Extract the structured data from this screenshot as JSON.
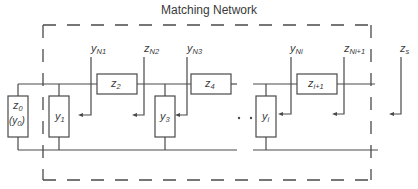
{
  "title": "Matching Network",
  "components": {
    "z0": {
      "main": "z",
      "sub": "0",
      "alt_main": "(y",
      "alt_sub": "0",
      "alt_close": ")"
    },
    "y1": {
      "main": "y",
      "sub": "1"
    },
    "z2": {
      "main": "z",
      "sub": "2"
    },
    "y3": {
      "main": "y",
      "sub": "3"
    },
    "z4": {
      "main": "z",
      "sub": "4"
    },
    "yi": {
      "main": "y",
      "sub": "i"
    },
    "zi1": {
      "main": "z",
      "sub": "i+1"
    }
  },
  "ports": {
    "yN1": {
      "main": "y",
      "sub": "N1"
    },
    "zN2": {
      "main": "z",
      "sub": "N2"
    },
    "yN3": {
      "main": "y",
      "sub": "N3"
    },
    "yNi": {
      "main": "y",
      "sub": "Ni"
    },
    "zNi1": {
      "main": "z",
      "sub": "Ni+1"
    },
    "zs": {
      "main": "z",
      "sub": "s"
    }
  },
  "ellipsis": "· ·",
  "colors": {
    "stroke": "#4a4a4a",
    "text": "#3a3a3a",
    "background": "#ffffff"
  }
}
